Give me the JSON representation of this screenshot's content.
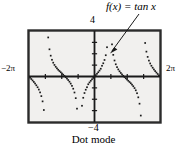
{
  "figure": {
    "caption": "Dot mode",
    "function_label": "f(x) = tan x",
    "axis_labels": {
      "top": "4",
      "bottom": "−4",
      "left": "−2π",
      "right": "2π"
    },
    "colors": {
      "ink": "#1a1a1a",
      "screen_bg": "#f1f0ee",
      "frame": "#2b2b2b",
      "page_bg": "#ffffff"
    }
  },
  "chart_data": {
    "type": "scatter",
    "title": "",
    "subtitle": "",
    "xlabel": "",
    "ylabel": "",
    "annotations": [
      {
        "text": "f(x) = tan x",
        "target_x": 0.55,
        "target_y": 2.0
      },
      {
        "text": "Dot mode",
        "position": "below-figure"
      }
    ],
    "legend": [],
    "legend_position": "none",
    "grid": false,
    "dot_mode": true,
    "xlim": [
      -6.283185307,
      6.283185307
    ],
    "ylim": [
      -4,
      4
    ],
    "xtick_labels": [
      "−2π",
      "2π"
    ],
    "ytick_labels": [
      "4",
      "−4"
    ],
    "xticks": [
      -6.283185307,
      6.283185307
    ],
    "yticks": [
      -4,
      4
    ],
    "x_tick_spacing": 1.5707963,
    "y_tick_spacing": 1.0,
    "asymptotes": [
      -4.71238898,
      -1.570796327,
      1.570796327,
      4.71238898
    ],
    "series": [
      {
        "name": "tan x",
        "function": "tan",
        "branches": [
          {
            "name": "branch-left-outer",
            "x": [
              -6.18,
              -6.06,
              -5.94,
              -5.82,
              -5.7,
              -5.58,
              -5.46,
              -5.34,
              -5.22,
              -5.1,
              -4.98,
              -4.86
            ],
            "y": [
              -0.101,
              -0.222,
              -0.347,
              -0.477,
              -0.617,
              -0.771,
              -0.944,
              -1.148,
              -1.398,
              -1.724,
              -2.186,
              -2.946
            ]
          },
          {
            "name": "branch-left-inner-a",
            "x": [
              -4.56,
              -4.44,
              -4.32,
              -4.2,
              -4.08,
              -3.96,
              -3.84,
              -3.72,
              -3.6,
              -3.48,
              -3.36,
              -3.24,
              -3.12,
              -3.0,
              -2.88,
              -2.76,
              -2.64,
              -2.52,
              -2.4,
              -2.28,
              -2.16,
              -2.04,
              -1.92,
              -1.8,
              -1.68
            ],
            "y": [
              6.651,
              3.434,
              2.39,
              1.83,
              1.471,
              1.215,
              1.017,
              0.855,
              0.717,
              0.593,
              0.48,
              0.372,
              0.266,
              0.159,
              0.05,
              -0.063,
              -0.183,
              -0.313,
              -0.458,
              -0.625,
              -0.824,
              -1.073,
              -1.407,
              -1.903,
              -2.826
            ]
          },
          {
            "name": "branch-center",
            "x": [
              -1.44,
              -1.32,
              -1.2,
              -1.08,
              -0.96,
              -0.84,
              -0.72,
              -0.6,
              -0.48,
              -0.36,
              -0.24,
              -0.12,
              0.0,
              0.12,
              0.24,
              0.36,
              0.48,
              0.6,
              0.72,
              0.84,
              0.96,
              1.08,
              1.2,
              1.32,
              1.44
            ],
            "y": [
              -7.602,
              -4.072,
              -2.572,
              -1.871,
              -1.452,
              -1.162,
              -0.942,
              -0.684,
              -0.521,
              -0.377,
              -0.244,
              -0.121,
              0.0,
              0.121,
              0.244,
              0.377,
              0.521,
              0.684,
              0.942,
              1.162,
              1.452,
              1.871,
              2.572,
              4.072,
              7.602
            ]
          },
          {
            "name": "branch-right-inner-a",
            "x": [
              1.68,
              1.8,
              1.92,
              2.04,
              2.16,
              2.28,
              2.4,
              2.52,
              2.64,
              2.76,
              2.88,
              3.0,
              3.12,
              3.24,
              3.36,
              3.48,
              3.6,
              3.72,
              3.84,
              3.96,
              4.08,
              4.2,
              4.32,
              4.44,
              4.56
            ],
            "y": [
              2.826,
              1.903,
              1.407,
              1.073,
              0.824,
              0.625,
              0.458,
              0.313,
              0.183,
              0.063,
              -0.05,
              -0.159,
              -0.266,
              -0.372,
              -0.48,
              -0.593,
              -0.717,
              -0.855,
              -1.017,
              -1.215,
              -1.471,
              -1.83,
              -2.39,
              -3.434,
              -6.651
            ]
          },
          {
            "name": "branch-right-outer",
            "x": [
              4.86,
              4.98,
              5.1,
              5.22,
              5.34,
              5.46,
              5.58,
              5.7,
              5.82,
              5.94,
              6.06,
              6.18
            ],
            "y": [
              2.946,
              2.186,
              1.724,
              1.398,
              1.148,
              0.944,
              0.771,
              0.617,
              0.477,
              0.347,
              0.222,
              0.101
            ]
          }
        ]
      }
    ]
  }
}
